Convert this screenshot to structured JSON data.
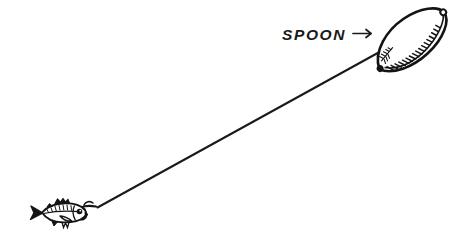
{
  "illustration": {
    "title": "Fishing rig: baitfish on hook attached by line to a spoon lure",
    "background_color": "#ffffff",
    "ink_color": "#141414",
    "line_color": "#1a1a1a",
    "width": 458,
    "height": 247
  },
  "annotation": {
    "label": "SPOON",
    "arrow_glyph": "→",
    "arrow_name": "right-arrow-pointer",
    "points_to": "spoon-lure",
    "x": 282,
    "y": 40
  },
  "parts": {
    "spoon_lure": {
      "name": "spoon-lure",
      "shape": "elongated leaf / oval blade",
      "hatching": "inner hatch marks along lower-right inner edge",
      "tilt_degrees": -40,
      "center_x": 411,
      "center_y": 40,
      "length": 86,
      "width": 42,
      "hatch_count": 17
    },
    "fishing_line": {
      "name": "fishing-line",
      "from_x": 97,
      "from_y": 207,
      "to_x": 443,
      "to_y": 17,
      "stroke_width": 2
    },
    "hook": {
      "name": "fish-hook",
      "x": 82,
      "y": 210
    },
    "baitfish": {
      "name": "baitfish",
      "facing": "right",
      "x": 30,
      "y": 200,
      "length": 60,
      "height": 26,
      "features": [
        "forked tail",
        "dorsal fin",
        "pectoral fin",
        "dark eye",
        "barbel mark"
      ]
    },
    "ring_near": {
      "name": "spoon-lower-attachment-ring",
      "x": 381,
      "y": 62
    },
    "ring_far": {
      "name": "spoon-upper-attachment-ring",
      "x": 440,
      "y": 18
    }
  }
}
